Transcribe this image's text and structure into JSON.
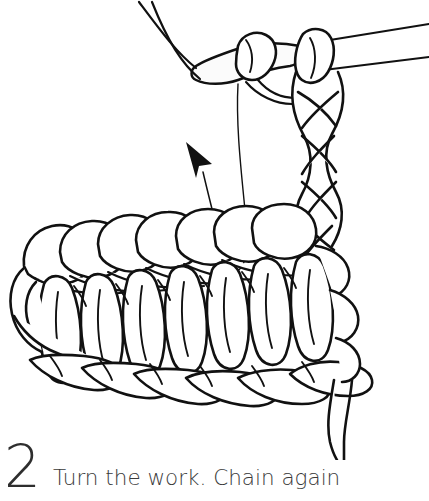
{
  "page": {
    "background_color": "#ffffff",
    "ink_color": "#111111",
    "text_color": "#3a3a3a",
    "width": 429,
    "height": 501
  },
  "illustration": {
    "title": "crochet-turning-chain-diagram",
    "subject": "crochet hook with working chain above a row of double crochet stitches",
    "alt": "Line drawing of a crochet hook holding a chain of stitches at the right edge of a crocheted swatch, with an arrow indicating the direction to turn the work",
    "elements": [
      {
        "name": "crochet-hook",
        "description": "hook shaft entering from the right edge with rounded hook tip at left"
      },
      {
        "name": "working-chain",
        "description": "vertical braided chain of 5 chain stitches at the right side",
        "stitch_count": 5
      },
      {
        "name": "fabric-swatch",
        "description": "row of double crochet posts with top chain row and foundation chain row",
        "post_count": 7
      },
      {
        "name": "yarn-strand",
        "description": "thin working yarn descending from hook tip into the fabric"
      },
      {
        "name": "direction-arrow",
        "description": "curved arrow pointing up and to the left"
      },
      {
        "name": "yarn-tail",
        "description": "loose yarn tail hanging from the bottom right of the swatch"
      }
    ]
  },
  "caption": {
    "step_number": "2",
    "text": "Turn the work. Chain again"
  }
}
